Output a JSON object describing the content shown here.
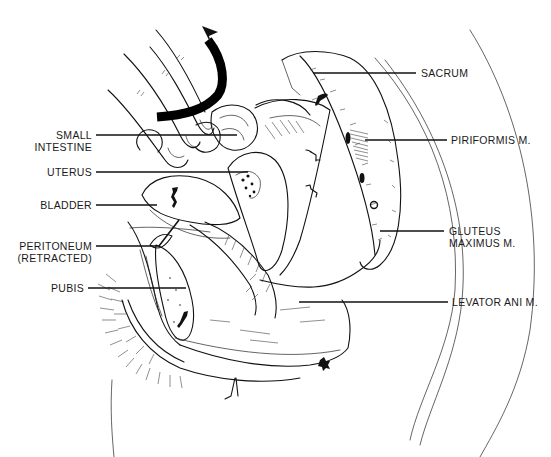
{
  "figure": {
    "type": "anatomical line drawing",
    "arrow": "curved-rotation-arrow"
  },
  "labels": {
    "sacrum": [
      "SACRUM"
    ],
    "small_intestine": [
      "SMALL",
      "INTESTINE"
    ],
    "piriformis": [
      "PIRIFORMIS M."
    ],
    "uterus": [
      "UTERUS"
    ],
    "bladder": [
      "BLADDER"
    ],
    "gluteus": [
      "GLUTEUS",
      "MAXIMUS M."
    ],
    "peritoneum": [
      "PERITONEUM",
      "(RETRACTED)"
    ],
    "pubis": [
      "PUBIS"
    ],
    "levator": [
      "LEVATOR ANI M."
    ]
  }
}
